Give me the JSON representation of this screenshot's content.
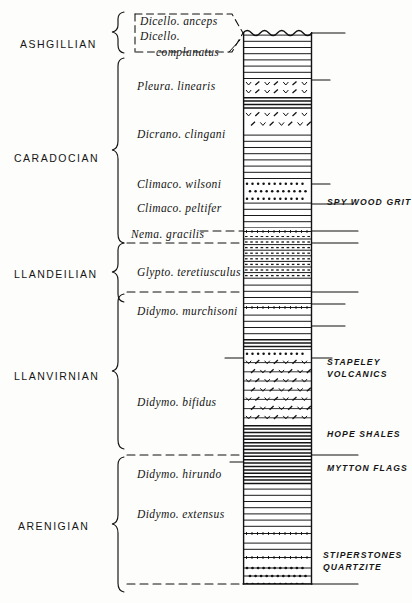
{
  "figure": {
    "type": "stratigraphic-column",
    "region": "Shelve / Shropshire Ordovician succession",
    "column": {
      "top_contact": "wavy-unconformity"
    }
  },
  "series": [
    {
      "name": "ASHGILLIAN",
      "x": 20,
      "y": 38,
      "top": 32,
      "bottom": 60
    },
    {
      "name": "CARADOCIAN",
      "x": 14,
      "y": 152,
      "top": 60,
      "bottom": 232
    },
    {
      "name": "LLANDEILIAN",
      "x": 14,
      "y": 268,
      "top": 232,
      "bottom": 292
    },
    {
      "name": "LLANVIRNIAN",
      "x": 14,
      "y": 370,
      "top": 292,
      "bottom": 455
    },
    {
      "name": "ARENIGIAN",
      "x": 18,
      "y": 520,
      "top": 455,
      "bottom": 584
    }
  ],
  "zones": [
    {
      "name": "Dicello. anceps",
      "x": 140,
      "y": 15,
      "style": "boxed"
    },
    {
      "name": "Dicello.\ncomplanatus",
      "x": 140,
      "y": 29,
      "style": "boxed-indent"
    },
    {
      "name": "Pleura. linearis",
      "x": 137,
      "y": 80,
      "style": "plain"
    },
    {
      "name": "Dicrano. clingani",
      "x": 137,
      "y": 128,
      "style": "plain"
    },
    {
      "name": "Climaco. wilsoni",
      "x": 137,
      "y": 178,
      "style": "plain"
    },
    {
      "name": "Climaco. peltifer",
      "x": 137,
      "y": 202,
      "style": "plain"
    },
    {
      "name": "Nema. gracilis",
      "x": 131,
      "y": 228,
      "style": "dashed-lead"
    },
    {
      "name": "Glypto. teretiusculus",
      "x": 137,
      "y": 266,
      "style": "plain"
    },
    {
      "name": "Didymo. murchisoni",
      "x": 137,
      "y": 305,
      "style": "plain"
    },
    {
      "name": "Didymo. bifidus",
      "x": 137,
      "y": 396,
      "style": "plain"
    },
    {
      "name": "Didymo. hirundo",
      "x": 137,
      "y": 468,
      "style": "plain"
    },
    {
      "name": "Didymo. extensus",
      "x": 137,
      "y": 508,
      "style": "plain"
    }
  ],
  "formations": [
    {
      "name": "SPY WOOD GRIT",
      "x": 327,
      "y": 196
    },
    {
      "name": "STAPELEY\n      VOLCANICS",
      "x": 327,
      "y": 356
    },
    {
      "name": "HOPE SHALES",
      "x": 327,
      "y": 428
    },
    {
      "name": "MYTTON FLAGS",
      "x": 327,
      "y": 462
    },
    {
      "name": "STIPERSTONES\n    QUARTZITE",
      "x": 323,
      "y": 549
    }
  ],
  "beds": [
    {
      "id": "b01",
      "top": 0,
      "height": 48,
      "pattern": "shale",
      "name": "ashgillian-shale"
    },
    {
      "id": "b02",
      "top": 48,
      "height": 8,
      "pattern": "tuff",
      "name": "tuff-band-1"
    },
    {
      "id": "b03",
      "top": 56,
      "height": 8,
      "pattern": "tuff",
      "name": "tuff-band-2"
    },
    {
      "id": "b04",
      "top": 64,
      "height": 14,
      "pattern": "dark-shale",
      "name": "dark-shale-1"
    },
    {
      "id": "b05",
      "top": 78,
      "height": 22,
      "pattern": "tuff-coarse",
      "name": "coarse-tuff"
    },
    {
      "id": "b06",
      "top": 100,
      "height": 48,
      "pattern": "shale",
      "name": "wilsoni-shale"
    },
    {
      "id": "b07",
      "top": 148,
      "height": 20,
      "pattern": "grit",
      "name": "spy-wood-grit"
    },
    {
      "id": "b08",
      "top": 168,
      "height": 28,
      "pattern": "shale",
      "name": "peltifer-shale"
    },
    {
      "id": "b09",
      "top": 196,
      "height": 8,
      "pattern": "silt-dash",
      "name": "silt-band-1"
    },
    {
      "id": "b10",
      "top": 204,
      "height": 46,
      "pattern": "flaggy",
      "name": "teretiusculus-flags"
    },
    {
      "id": "b11",
      "top": 250,
      "height": 22,
      "pattern": "shale",
      "name": "murchisoni-shale"
    },
    {
      "id": "b12",
      "top": 272,
      "height": 8,
      "pattern": "silt-dash",
      "name": "silt-band-2"
    },
    {
      "id": "b13",
      "top": 280,
      "height": 26,
      "pattern": "shale",
      "name": "shale-band"
    },
    {
      "id": "b14",
      "top": 306,
      "height": 12,
      "pattern": "dark-shale",
      "name": "dark-shale-2"
    },
    {
      "id": "b15",
      "top": 318,
      "height": 8,
      "pattern": "grit",
      "name": "grit-band"
    },
    {
      "id": "b16",
      "top": 326,
      "height": 66,
      "pattern": "volcanic",
      "name": "stapeley-volcanics"
    },
    {
      "id": "b17",
      "top": 392,
      "height": 62,
      "pattern": "dark-shale",
      "name": "hope-shales"
    },
    {
      "id": "b18",
      "top": 454,
      "height": 44,
      "pattern": "shale",
      "name": "mytton-flags"
    },
    {
      "id": "b19",
      "top": 498,
      "height": 10,
      "pattern": "silt-dash",
      "name": "silt-band-3"
    },
    {
      "id": "b20",
      "top": 508,
      "height": 14,
      "pattern": "shale",
      "name": "shale-band-2"
    },
    {
      "id": "b21",
      "top": 522,
      "height": 10,
      "pattern": "silt-dash",
      "name": "silt-band-4"
    },
    {
      "id": "b22",
      "top": 532,
      "height": 64,
      "pattern": "quartzite",
      "name": "stiperstones-quartzite"
    }
  ],
  "colors": {
    "ink": "#111111",
    "paper": "#fdfdfb",
    "shade": "#555555"
  }
}
